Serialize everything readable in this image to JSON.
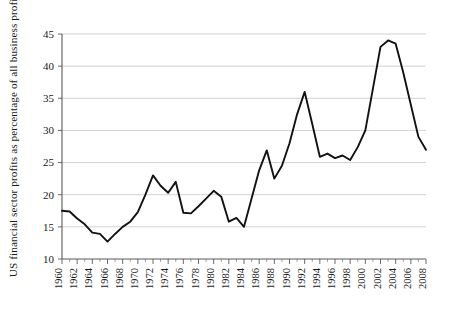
{
  "chart_data": {
    "type": "line",
    "title": "",
    "xlabel": "",
    "ylabel": "US financial sector profits as percentage of all business profits",
    "xlim": [
      1960,
      2008
    ],
    "ylim": [
      10,
      45
    ],
    "yticks": [
      10,
      15,
      20,
      25,
      30,
      35,
      40,
      45
    ],
    "xticks": [
      1960,
      1962,
      1964,
      1966,
      1968,
      1970,
      1972,
      1974,
      1976,
      1978,
      1980,
      1982,
      1984,
      1986,
      1988,
      1990,
      1992,
      1994,
      1996,
      1998,
      2000,
      2002,
      2004,
      2006,
      2008
    ],
    "grid": "horizontal",
    "legend": "none",
    "line_color": "#121212",
    "grid_color": "#bfbfbf",
    "x": [
      1960,
      1961,
      1962,
      1963,
      1964,
      1965,
      1966,
      1967,
      1968,
      1969,
      1970,
      1971,
      1972,
      1973,
      1974,
      1975,
      1976,
      1977,
      1978,
      1979,
      1980,
      1981,
      1982,
      1983,
      1984,
      1985,
      1986,
      1987,
      1988,
      1989,
      1990,
      1991,
      1992,
      1993,
      1994,
      1995,
      1996,
      1997,
      1998,
      1999,
      2000,
      2001,
      2002,
      2003,
      2004,
      2005,
      2006,
      2007,
      2008
    ],
    "values": [
      17.5,
      17.4,
      16.3,
      15.4,
      14.1,
      13.9,
      12.7,
      13.9,
      15.0,
      15.8,
      17.3,
      20.0,
      23.0,
      21.4,
      20.3,
      22.0,
      17.2,
      17.1,
      18.2,
      19.4,
      20.6,
      19.7,
      15.8,
      16.4,
      15.0,
      19.4,
      23.8,
      26.9,
      22.5,
      24.5,
      28.0,
      32.5,
      36.0,
      31.0,
      25.9,
      26.4,
      25.7,
      26.1,
      25.4,
      27.4,
      30.0,
      36.5,
      43.0,
      44.0,
      43.5,
      39.0,
      34.0,
      29.0,
      27.0
    ],
    "xtick_labels": [
      "1960",
      "1962",
      "1964",
      "1966",
      "1968",
      "1970",
      "1972",
      "1974",
      "1976",
      "1978",
      "1980",
      "1982",
      "1984",
      "1986",
      "1988",
      "1990",
      "1992",
      "1994",
      "1996",
      "1998",
      "2000",
      "2002",
      "2004",
      "2006",
      "2008"
    ],
    "ytick_labels": [
      "10",
      "15",
      "20",
      "25",
      "30",
      "35",
      "40",
      "45"
    ]
  }
}
